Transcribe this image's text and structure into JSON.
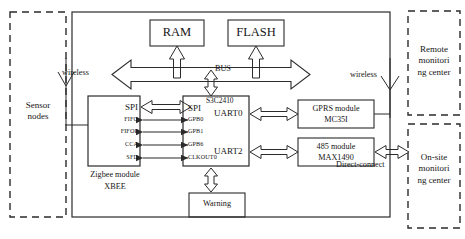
{
  "diagram": {
    "outer_frame": {
      "name": "gateway-enclosure",
      "style": "solid"
    },
    "memory": [
      {
        "id": "ram",
        "label": "RAM"
      },
      {
        "id": "flash",
        "label": "FLASH"
      }
    ],
    "bus": {
      "label": "BUS"
    },
    "mcu": {
      "name": "S3C2410",
      "left_ports": [
        "SPI",
        "GPB0",
        "GPB1",
        "GPB6",
        "CLKOUT0"
      ],
      "right_ports": [
        "UART0",
        "UART2"
      ]
    },
    "zigbee": {
      "ports": [
        "SPI",
        "FIFO",
        "FIFOP",
        "CCA",
        "SFD"
      ],
      "caption_line1": "Zigbee module",
      "caption_line2": "XBEE"
    },
    "warning": {
      "label": "Warning"
    },
    "comm_modules": [
      {
        "id": "gprs",
        "line1": "GPRS module",
        "line2": "MC35I"
      },
      {
        "id": "rs485",
        "line1": "485 module",
        "line2": "MAX1490"
      }
    ],
    "link_labels": {
      "wireless_left": "wireless",
      "wireless_right": "wireless",
      "direct_connect": "Direct-connect"
    },
    "external": [
      {
        "id": "sensor-nodes",
        "text": "Sensor\nnodes"
      },
      {
        "id": "remote-center",
        "text": "Remote\nmonitori\nng center"
      },
      {
        "id": "onsite-center",
        "text": "On-site\nmonitori\nng center"
      }
    ],
    "colors": {
      "stroke": "#2b2b2b",
      "text": "#151515",
      "background": "#ffffff"
    }
  }
}
